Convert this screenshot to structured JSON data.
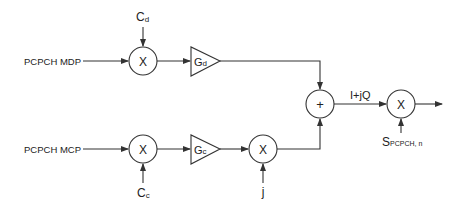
{
  "diagram": {
    "inputs": {
      "upper": "PCPCH MDP",
      "lower": "PCPCH MCP"
    },
    "codes": {
      "upper": {
        "base": "C",
        "sub": "d"
      },
      "lower": {
        "base": "C",
        "sub": "c"
      }
    },
    "gains": {
      "upper": {
        "base": "G",
        "sub": "d"
      },
      "lower": {
        "base": "G",
        "sub": "c"
      }
    },
    "operators": {
      "multiply": "X",
      "add": "+"
    },
    "j_label": "j",
    "iq_label": "I+jQ",
    "scrambling": {
      "base": "S",
      "sub": "PCPCH, n"
    },
    "colors": {
      "stroke": "#333333",
      "text": "#222222",
      "background": "#ffffff"
    }
  }
}
